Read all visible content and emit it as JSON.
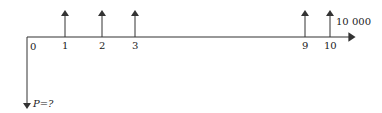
{
  "diagram": {
    "type": "cash-flow-diagram",
    "axis": {
      "periods": [
        {
          "label": "0",
          "x": 27,
          "arrow": "down"
        },
        {
          "label": "1",
          "x": 65,
          "arrow": "up"
        },
        {
          "label": "2",
          "x": 102,
          "arrow": "up"
        },
        {
          "label": "3",
          "x": 135,
          "arrow": "up"
        },
        {
          "label": "9",
          "x": 305,
          "arrow": "up"
        },
        {
          "label": "10",
          "x": 330,
          "arrow": "up"
        }
      ]
    },
    "labels": {
      "present_value": "P=?",
      "final_amount": "10 000"
    },
    "colors": {
      "line": "#333333",
      "text": "#222222"
    }
  }
}
